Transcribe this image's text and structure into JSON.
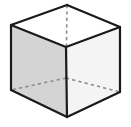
{
  "figure": {
    "name": "cube-wireframe-illustration",
    "shape_type": "cube",
    "projection": "isometric",
    "canvas": {
      "width": 131,
      "height": 127,
      "background": "#ffffff"
    },
    "colors": {
      "background": "#ffffff",
      "top_face": "#ffffff",
      "left_face": "#d4d4d4",
      "right_face": "#f4f4f4",
      "visible_edge": "#1a1a1a",
      "hidden_edge": "#8c8c8c"
    },
    "stroke": {
      "visible_edge_width": 2.2,
      "hidden_edge_width": 1.6,
      "hidden_edge_dash": "3.2,3.2"
    },
    "vertices": {
      "back_top": {
        "x": 67,
        "y": 5,
        "visible": true,
        "label": "back-top-vertex"
      },
      "left_top": {
        "x": 11,
        "y": 25,
        "visible": true,
        "label": "left-top-vertex"
      },
      "right_top": {
        "x": 120,
        "y": 27,
        "visible": true,
        "label": "right-top-vertex"
      },
      "front_top": {
        "x": 66,
        "y": 47,
        "visible": true,
        "label": "front-top-vertex"
      },
      "left_bottom": {
        "x": 11,
        "y": 90,
        "visible": true,
        "label": "left-bottom-vertex"
      },
      "right_bottom": {
        "x": 120,
        "y": 92,
        "visible": true,
        "label": "right-bottom-vertex"
      },
      "front_bottom": {
        "x": 67,
        "y": 117,
        "visible": true,
        "label": "front-bottom-vertex"
      },
      "back_bottom": {
        "x": 66,
        "y": 78,
        "visible": false,
        "label": "hidden-back-bottom-vertex"
      }
    },
    "faces": [
      {
        "name": "top-face",
        "fill": "#ffffff",
        "points": "67,5 120,27 66,47 11,25"
      },
      {
        "name": "left-face",
        "fill": "#d4d4d4",
        "points": "11,25 66,47 67,117 11,90"
      },
      {
        "name": "right-face",
        "fill": "#f4f4f4",
        "points": "66,47 120,27 120,92 67,117"
      }
    ],
    "visible_edges": [
      {
        "name": "edge-back-top-to-left-top",
        "x1": 67,
        "y1": 5,
        "x2": 11,
        "y2": 25
      },
      {
        "name": "edge-back-top-to-right-top",
        "x1": 67,
        "y1": 5,
        "x2": 120,
        "y2": 27
      },
      {
        "name": "edge-left-top-to-front-top",
        "x1": 11,
        "y1": 25,
        "x2": 66,
        "y2": 47
      },
      {
        "name": "edge-right-top-to-front-top",
        "x1": 120,
        "y1": 27,
        "x2": 66,
        "y2": 47
      },
      {
        "name": "edge-left-vertical",
        "x1": 11,
        "y1": 25,
        "x2": 11,
        "y2": 90
      },
      {
        "name": "edge-front-vertical",
        "x1": 66,
        "y1": 47,
        "x2": 67,
        "y2": 117
      },
      {
        "name": "edge-right-vertical",
        "x1": 120,
        "y1": 27,
        "x2": 120,
        "y2": 92
      },
      {
        "name": "edge-left-bottom-to-front-bottom",
        "x1": 11,
        "y1": 90,
        "x2": 67,
        "y2": 117
      },
      {
        "name": "edge-right-bottom-to-front-bottom",
        "x1": 120,
        "y1": 92,
        "x2": 67,
        "y2": 117
      }
    ],
    "hidden_edges": [
      {
        "name": "hidden-edge-back-vertical",
        "x1": 67,
        "y1": 5,
        "x2": 66,
        "y2": 78
      },
      {
        "name": "hidden-edge-back-bottom-to-left",
        "x1": 66,
        "y1": 78,
        "x2": 11,
        "y2": 90
      },
      {
        "name": "hidden-edge-back-bottom-to-right",
        "x1": 66,
        "y1": 78,
        "x2": 120,
        "y2": 92
      }
    ]
  }
}
